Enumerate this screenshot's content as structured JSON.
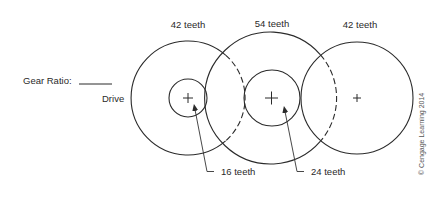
{
  "diagram": {
    "gear_ratio_label": "Gear Ratio:",
    "gear_ratio_blank": "______",
    "drive_label": "Drive",
    "copyright": "© Cengage Learning 2014",
    "gears": [
      {
        "id": "left-large",
        "label": "42 teeth",
        "cx": 188,
        "cy": 98,
        "r": 57
      },
      {
        "id": "middle-large",
        "label": "54 teeth",
        "cx": 271,
        "cy": 98,
        "r": 66
      },
      {
        "id": "right-large",
        "label": "42 teeth",
        "cx": 357,
        "cy": 98,
        "r": 57
      },
      {
        "id": "left-small",
        "label": "16 teeth",
        "cx": 188,
        "cy": 98,
        "r": 19
      },
      {
        "id": "middle-small",
        "label": "24 teeth",
        "cx": 272,
        "cy": 98,
        "r": 28
      }
    ],
    "callouts": {
      "left_small": "16 teeth",
      "middle_small": "24 teeth"
    },
    "top_labels": {
      "left": "42 teeth",
      "middle": "54 teeth",
      "right": "42 teeth"
    }
  }
}
